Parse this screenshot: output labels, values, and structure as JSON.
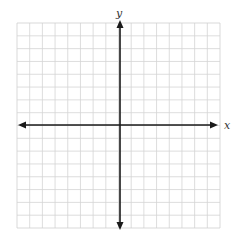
{
  "diagram": {
    "type": "coordinate-plane",
    "grid": {
      "columns": 16,
      "rows": 16,
      "left": 17,
      "top": 23,
      "right": 220,
      "bottom": 228,
      "line_color": "#d4d4d4",
      "border_color": "#cfcfcf"
    },
    "origin": {
      "x": 120,
      "y": 125
    },
    "axes": {
      "color": "#1a1a1a",
      "x_axis": {
        "label": "x",
        "from_x": 18,
        "to_x": 218,
        "arrows": "both"
      },
      "y_axis": {
        "label": "y",
        "from_y": 20,
        "to_y": 230,
        "arrows": "both"
      }
    }
  }
}
